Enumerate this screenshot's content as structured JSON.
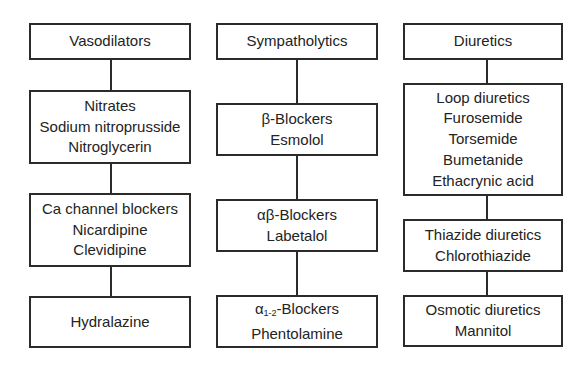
{
  "diagram": {
    "type": "tree",
    "columns": [
      {
        "header": "Vasodilators",
        "boxes": [
          {
            "lines": [
              "Nitrates",
              "Sodium nitroprusside",
              "Nitroglycerin"
            ]
          },
          {
            "lines": [
              "Ca channel blockers",
              "Nicardipine",
              "Clevidipine"
            ]
          },
          {
            "lines": [
              "Hydralazine"
            ]
          }
        ]
      },
      {
        "header": "Sympatholytics",
        "boxes": [
          {
            "lines": [
              "β-Blockers",
              "Esmolol"
            ]
          },
          {
            "lines": [
              "αβ-Blockers",
              "Labetalol"
            ]
          },
          {
            "symbol": "α",
            "subscript": "1-2",
            "suffix": "-Blockers",
            "lines": [
              "α1-2-Blockers",
              "Phentolamine"
            ]
          }
        ]
      },
      {
        "header": "Diuretics",
        "boxes": [
          {
            "lines": [
              "Loop diuretics",
              "Furosemide",
              "Torsemide",
              "Bumetanide",
              "Ethacrynic acid"
            ]
          },
          {
            "lines": [
              "Thiazide diuretics",
              "Chlorothiazide"
            ]
          },
          {
            "lines": [
              "Osmotic diuretics",
              "Mannitol"
            ]
          }
        ]
      }
    ]
  },
  "colors": {
    "border": "#2b2b2b",
    "text": "#232323",
    "background": "#ffffff"
  }
}
